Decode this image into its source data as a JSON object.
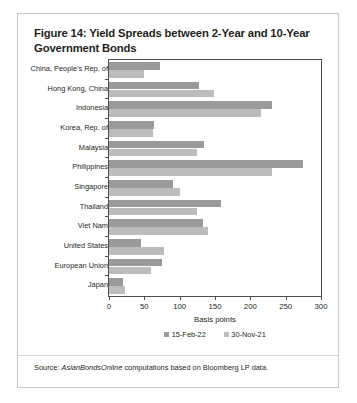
{
  "figure": {
    "title": "Figure 14: Yield Spreads between 2-Year and 10-Year Government Bonds",
    "source_prefix": "Source: ",
    "source_italic": "AsianBondsOnline",
    "source_rest": " computations based on Bloomberg LP data."
  },
  "colors": {
    "series_15_feb_22": "#9a9a9a",
    "series_30_nov_21": "#bcbcbc",
    "axis": "#4d4d4d",
    "text": "#231f20",
    "card_border": "#c8c8c8"
  },
  "chart_data": {
    "type": "bar",
    "orientation": "horizontal",
    "title": "Figure 14: Yield Spreads between 2-Year and 10-Year Government Bonds",
    "xlabel": "Basis points",
    "ylabel": "",
    "xlim": [
      0,
      300
    ],
    "xticks": [
      0,
      50,
      100,
      150,
      200,
      250,
      300
    ],
    "xtick_labels": [
      "0",
      "50",
      "100",
      "150",
      "200",
      "250",
      "300"
    ],
    "grid": false,
    "legend_position": "bottom",
    "categories": [
      "China, People's Rep. of",
      "Hong Kong, China",
      "Indonesia",
      "Korea, Rep. of",
      "Malaysia",
      "Philippines",
      "Singapore",
      "Thailand",
      "Viet Nam",
      "United States",
      "European Union",
      "Japan"
    ],
    "series": [
      {
        "name": "15-Feb-22",
        "color": "#9a9a9a",
        "values": [
          72,
          128,
          230,
          63,
          135,
          275,
          90,
          158,
          133,
          45,
          75,
          20
        ]
      },
      {
        "name": "30-Nov-21",
        "color": "#bcbcbc",
        "values": [
          50,
          148,
          215,
          62,
          125,
          230,
          100,
          125,
          140,
          78,
          60,
          23
        ]
      }
    ]
  }
}
